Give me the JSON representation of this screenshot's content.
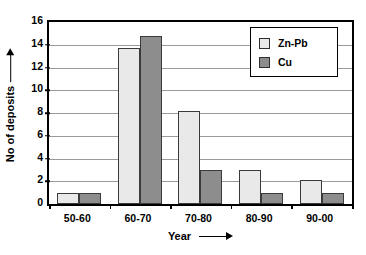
{
  "chart_data": {
    "type": "bar",
    "title": "",
    "xlabel": "Year",
    "ylabel": "No of deposits",
    "categories": [
      "50-60",
      "60-70",
      "70-80",
      "80-90",
      "90-00"
    ],
    "series": [
      {
        "name": "Zn-Pb",
        "color": "#e9e9e9",
        "values": [
          1,
          13.7,
          8.2,
          3,
          2.1
        ]
      },
      {
        "name": "Cu",
        "color": "#8d8d8d",
        "values": [
          1,
          14.8,
          3,
          1,
          1
        ]
      }
    ],
    "ylim": [
      0,
      16
    ],
    "ytick_values": [
      0,
      2,
      4,
      6,
      8,
      10,
      12,
      14,
      16
    ],
    "ytick_labels": [
      "0",
      "2",
      "4",
      "6",
      "8",
      "10",
      "12",
      "14",
      "16"
    ],
    "grid": true,
    "legend_position": "top-right",
    "xlabel_arrow": "→",
    "ylabel_arrow": "↑"
  },
  "axes": {
    "y_title": "No of deposits",
    "x_title": "Year"
  },
  "legend": {
    "items": [
      {
        "label": "Zn-Pb"
      },
      {
        "label": "Cu"
      }
    ]
  }
}
